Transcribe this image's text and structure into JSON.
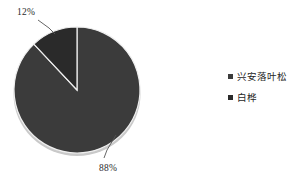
{
  "chart_data": {
    "type": "pie",
    "title": "",
    "categories": [
      "兴安落叶松",
      "白桦"
    ],
    "values": [
      88,
      12
    ],
    "value_labels": [
      "88%",
      "12%"
    ],
    "unit": "%",
    "legend_position": "right",
    "grid": false,
    "colors": [
      "#3b3b3b",
      "#2a2a2a"
    ],
    "background": "#ffffff",
    "slices": [
      {
        "label": "兴安落叶松",
        "value": 88,
        "display": "88%",
        "color": "#3b3b3b"
      },
      {
        "label": "白桦",
        "value": 12,
        "display": "12%",
        "color": "#2a2a2a"
      }
    ]
  },
  "labels": {
    "slice_large": "88%",
    "slice_small": "12%"
  },
  "legend": {
    "items": [
      {
        "label": "兴安落叶松",
        "color": "#3b3b3b"
      },
      {
        "label": "白桦",
        "color": "#2a2a2a"
      }
    ]
  }
}
